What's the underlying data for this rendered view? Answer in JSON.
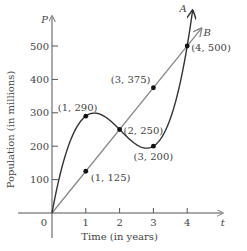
{
  "chart_data": {
    "type": "line",
    "title": "",
    "xlabel": "Time (in years)",
    "ylabel": "Population (in millions)",
    "x_axis_name": "t",
    "y_axis_name": "P",
    "xlim": [
      0,
      4.7
    ],
    "ylim": [
      0,
      560
    ],
    "x_ticks": [
      1,
      2,
      3,
      4
    ],
    "x_tick_labels": [
      "1",
      "2",
      "3",
      "4"
    ],
    "y_ticks": [
      100,
      200,
      300,
      400,
      500
    ],
    "y_tick_labels": [
      "100",
      "200",
      "300",
      "400",
      "500"
    ],
    "origin_label": "0",
    "grid": false,
    "series": [
      {
        "name": "A",
        "kind": "cubic-curve",
        "color": "#333333",
        "points": [
          [
            0,
            0
          ],
          [
            1,
            290
          ],
          [
            2,
            250
          ],
          [
            3,
            200
          ],
          [
            4,
            500
          ]
        ],
        "marked_points": [
          [
            1,
            290
          ],
          [
            2,
            250
          ],
          [
            3,
            200
          ],
          [
            4,
            500
          ]
        ]
      },
      {
        "name": "B",
        "kind": "straight-line",
        "color": "#888888",
        "points": [
          [
            0,
            0
          ],
          [
            1,
            125
          ],
          [
            2,
            250
          ],
          [
            3,
            375
          ],
          [
            4,
            500
          ]
        ],
        "marked_points": [
          [
            1,
            125
          ],
          [
            3,
            375
          ]
        ]
      }
    ],
    "annotations": [
      {
        "text": "(1, 290)",
        "x": 1,
        "y": 290
      },
      {
        "text": "(1, 125)",
        "x": 1,
        "y": 125
      },
      {
        "text": "(2, 250)",
        "x": 2,
        "y": 250
      },
      {
        "text": "(3, 375)",
        "x": 3,
        "y": 375
      },
      {
        "text": "(3, 200)",
        "x": 3,
        "y": 200
      },
      {
        "text": "(4, 500)",
        "x": 4,
        "y": 500
      }
    ]
  }
}
